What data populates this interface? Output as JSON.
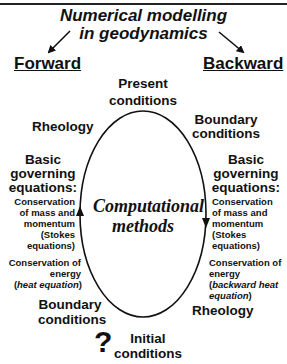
{
  "title": {
    "line1": "Numerical modelling",
    "line2": "in geodynamics"
  },
  "branches": {
    "forward": "Forward",
    "backward": "Backward"
  },
  "cycle": {
    "top": [
      "Present",
      "conditions"
    ],
    "bottom": [
      "Initial",
      "conditions"
    ],
    "bottom_marker": "?",
    "center": [
      "Computational",
      "methods"
    ]
  },
  "forward_side": {
    "rheology": "Rheology",
    "governing": [
      "Basic",
      "governing",
      "equations:"
    ],
    "mass": [
      "Conservation",
      "of mass and",
      "momentum",
      "(Stokes",
      "equations)"
    ],
    "energy": [
      "Conservation of",
      "energy",
      "(heat equation)"
    ],
    "energy_italic": "heat equation",
    "boundary": [
      "Boundary",
      "conditions"
    ]
  },
  "backward_side": {
    "boundary": [
      "Boundary",
      "conditions"
    ],
    "governing": [
      "Basic",
      "governing",
      "equations:"
    ],
    "mass": [
      "Conservation",
      "of mass and",
      "momentum",
      "(Stokes",
      "equations)"
    ],
    "energy": [
      "Conservation of",
      "energy",
      "(backward heat",
      "equation)"
    ],
    "energy_italic_1": "backward heat",
    "energy_italic_2": "equation",
    "rheology": "Rheology"
  },
  "colors": {
    "ink": "#111111",
    "background": "#ffffff"
  }
}
